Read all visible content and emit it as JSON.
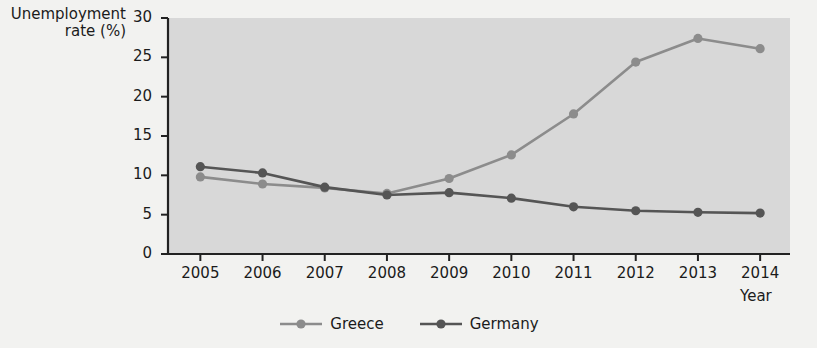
{
  "chart_data": {
    "type": "line",
    "title": "",
    "xlabel": "Year",
    "ylabel": "Unemployment rate (%)",
    "categories": [
      "2005",
      "2006",
      "2007",
      "2008",
      "2009",
      "2010",
      "2011",
      "2012",
      "2013",
      "2014"
    ],
    "xlim": [
      2005,
      2014
    ],
    "ylim": [
      0,
      30
    ],
    "yticks": [
      "0",
      "5",
      "10",
      "15",
      "20",
      "25",
      "30"
    ],
    "ytick_values": [
      0,
      5,
      10,
      15,
      20,
      25,
      30
    ],
    "grid": false,
    "legend_position": "bottom",
    "series": [
      {
        "name": "Greece",
        "color": "#8c8c8c",
        "values": [
          9.8,
          8.9,
          8.4,
          7.7,
          9.6,
          12.6,
          17.8,
          24.4,
          27.4,
          26.1
        ]
      },
      {
        "name": "Germany",
        "color": "#555555",
        "values": [
          11.1,
          10.3,
          8.5,
          7.5,
          7.8,
          7.1,
          6.0,
          5.5,
          5.3,
          5.2
        ]
      }
    ],
    "plot_background": "#d8d8d8",
    "axis_color": "#222222",
    "page_background": "#f2f2f0"
  }
}
